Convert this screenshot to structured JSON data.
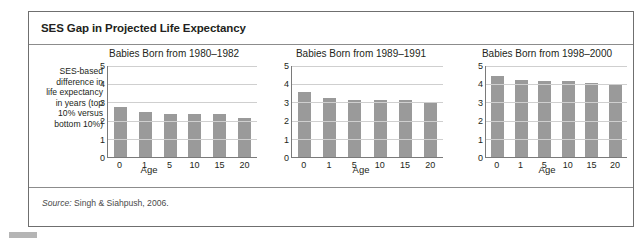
{
  "figure": {
    "title": "SES Gap in Projected Life Expectancy",
    "source_label": "Source:",
    "source_text": " Singh & Siahpush, 2006."
  },
  "y_caption_lines": [
    "SES-based",
    "difference in",
    "life expectancy",
    "in years (top",
    "10% versus",
    "bottom 10%)"
  ],
  "chart_data": [
    {
      "type": "bar",
      "title": "Babies Born from 1980–1982",
      "categories": [
        "0",
        "1",
        "5",
        "10",
        "15",
        "20"
      ],
      "values": [
        2.75,
        2.45,
        2.35,
        2.35,
        2.35,
        2.15
      ],
      "xlabel": "Age",
      "ylabel": "SES-based difference in life expectancy in years (top 10% versus bottom 10%)",
      "ylim": [
        0,
        5
      ],
      "yticks": [
        "5",
        "4",
        "3",
        "2",
        "1",
        "0"
      ],
      "grid": true,
      "legend": "none",
      "bar_color": "#9a9a9a"
    },
    {
      "type": "bar",
      "title": "Babies Born from 1989–1991",
      "categories": [
        "0",
        "1",
        "5",
        "10",
        "15",
        "20"
      ],
      "values": [
        3.55,
        3.25,
        3.15,
        3.15,
        3.15,
        2.95
      ],
      "xlabel": "Age",
      "ylabel": "",
      "ylim": [
        0,
        5
      ],
      "yticks": [
        "5",
        "4",
        "3",
        "2",
        "1",
        "0"
      ],
      "grid": true,
      "legend": "none",
      "bar_color": "#9a9a9a"
    },
    {
      "type": "bar",
      "title": "Babies Born from 1998–2000",
      "categories": [
        "0",
        "1",
        "5",
        "10",
        "15",
        "20"
      ],
      "values": [
        4.45,
        4.25,
        4.15,
        4.15,
        4.05,
        3.95
      ],
      "xlabel": "Age",
      "ylabel": "",
      "ylim": [
        0,
        5
      ],
      "yticks": [
        "5",
        "4",
        "3",
        "2",
        "1",
        "0"
      ],
      "grid": true,
      "legend": "none",
      "bar_color": "#9a9a9a"
    }
  ]
}
